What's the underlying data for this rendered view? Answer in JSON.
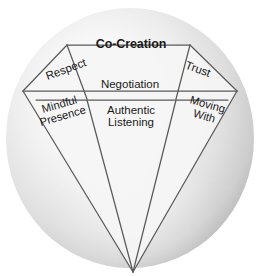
{
  "diagram": {
    "type": "gem-facet-diagram",
    "shape": "diamond",
    "background_shape": "sphere",
    "colors": {
      "sphere_highlight": "#fdfdfd",
      "sphere_mid": "#e3e3e3",
      "sphere_edge": "#b4b4b4",
      "facet_fill": "#f4f4f4",
      "facet_line": "#5a5a5a",
      "text": "#1a1a1a",
      "page_background": "#ffffff"
    },
    "labels": {
      "crown_top": "Co-Creation",
      "crown_left": "Respect",
      "crown_center": "Negotiation",
      "crown_right": "Trust",
      "girdle_left_line1": "Mindful",
      "girdle_left_line2": "Presence",
      "girdle_center_line1": "Authentic",
      "girdle_center_line2": "Listening",
      "girdle_right_line1": "Moving",
      "girdle_right_line2": "With"
    }
  }
}
